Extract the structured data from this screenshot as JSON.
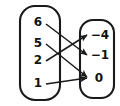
{
  "diagram": {
    "type": "mapping-diagram",
    "domain_set": {
      "name": "domain-oval",
      "label": "",
      "elements": [
        {
          "id": "d6",
          "text": "6",
          "x": 38,
          "y": 22
        },
        {
          "id": "d5",
          "text": "5",
          "x": 38,
          "y": 43
        },
        {
          "id": "d2",
          "text": "2",
          "x": 38,
          "y": 60
        },
        {
          "id": "d1",
          "text": "1",
          "x": 38,
          "y": 83
        }
      ],
      "shape": {
        "x": 20,
        "y": 6,
        "width": 40,
        "height": 94,
        "rx": 15
      }
    },
    "range_set": {
      "name": "range-oval",
      "label": "",
      "elements": [
        {
          "id": "r-4",
          "text": "−4",
          "x": 100,
          "y": 35
        },
        {
          "id": "r-1",
          "text": "−1",
          "x": 100,
          "y": 55
        },
        {
          "id": "r0",
          "text": "0",
          "x": 99,
          "y": 78
        }
      ],
      "shape": {
        "x": 80,
        "y": 20,
        "width": 34,
        "height": 78,
        "rx": 13
      }
    },
    "arrows": [
      {
        "id": "a1",
        "from": "6",
        "to": "−1",
        "x1": 46,
        "y1": 24,
        "x2": 87,
        "y2": 55
      },
      {
        "id": "a2",
        "from": "5",
        "to": "0",
        "x1": 46,
        "y1": 44,
        "x2": 87,
        "y2": 77
      },
      {
        "id": "a3",
        "from": "2",
        "to": "−4",
        "x1": 46,
        "y1": 61,
        "x2": 87,
        "y2": 35
      },
      {
        "id": "a4",
        "from": "1",
        "to": "0",
        "x1": 46,
        "y1": 84,
        "x2": 87,
        "y2": 78
      }
    ],
    "colors": {
      "stroke": "#1a1a1a",
      "text": "#111111",
      "background": "#ffffff"
    }
  },
  "chart_data": {
    "type": "diagram",
    "subtype": "mapping-diagram",
    "domain": [
      "6",
      "5",
      "2",
      "1"
    ],
    "range": [
      "-4",
      "-1",
      "0"
    ],
    "pairs": [
      {
        "input": "6",
        "output": "-1"
      },
      {
        "input": "5",
        "output": "0"
      },
      {
        "input": "2",
        "output": "-4"
      },
      {
        "input": "1",
        "output": "0"
      }
    ],
    "xlabel": "",
    "ylabel": "",
    "legend": []
  }
}
